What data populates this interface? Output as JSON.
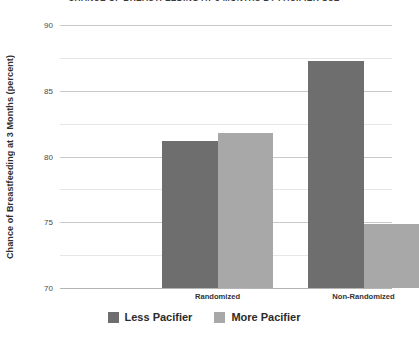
{
  "chart_data": {
    "type": "bar",
    "title": "CHANCE OF BREASTFEEDING AT 3 MONTHS BY PACIFIER USE",
    "xlabel": "",
    "ylabel": "Chance of Breastfeeding at 3 Months (percent)",
    "categories": [
      "Randomized",
      "Non-Randomized"
    ],
    "series": [
      {
        "name": "Less Pacifier",
        "color": "#6e6e6e",
        "values": [
          81.2,
          87.3
        ]
      },
      {
        "name": "More Pacifier",
        "color": "#a8a8a8",
        "values": [
          81.8,
          74.9
        ]
      }
    ],
    "ylim": [
      70,
      90
    ],
    "yticks": [
      90,
      85,
      80,
      75,
      70
    ],
    "ytick_labels": [
      "90",
      "85",
      "80",
      "75",
      "70"
    ],
    "minor_yticks": [
      87.5,
      82.5,
      77.5,
      72.5
    ],
    "grid": true,
    "legend_position": "bottom"
  }
}
